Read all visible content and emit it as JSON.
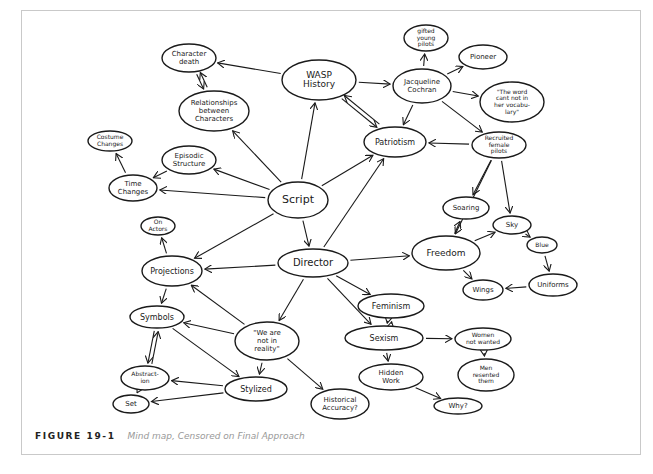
{
  "figure": {
    "caption_label": "FIGURE 19-1",
    "caption_text": "Mind map, Censored on Final Approach"
  },
  "colors": {
    "ink": "#1a1a1a",
    "frame": "#c9c9c9",
    "caption_text": "#999999"
  },
  "nodes": [
    {
      "id": "script",
      "lines": [
        "Script"
      ],
      "cx": 298,
      "cy": 200,
      "rx": 30,
      "ry": 18,
      "fs": 11
    },
    {
      "id": "wasp",
      "lines": [
        "WASP",
        "History"
      ],
      "cx": 319,
      "cy": 80,
      "rx": 37,
      "ry": 20,
      "fs": 9
    },
    {
      "id": "director",
      "lines": [
        "Director"
      ],
      "cx": 313,
      "cy": 263,
      "rx": 35,
      "ry": 14,
      "fs": 10
    },
    {
      "id": "character_death",
      "lines": [
        "Character",
        "death"
      ],
      "cx": 189,
      "cy": 58,
      "rx": 27,
      "ry": 14,
      "fs": 7
    },
    {
      "id": "relationships",
      "lines": [
        "Relationships",
        "between",
        "Characters"
      ],
      "cx": 214,
      "cy": 111,
      "rx": 35,
      "ry": 20,
      "fs": 7
    },
    {
      "id": "costume",
      "lines": [
        "Costume",
        "Changes"
      ],
      "cx": 110,
      "cy": 141,
      "rx": 22,
      "ry": 10,
      "fs": 6
    },
    {
      "id": "episodic",
      "lines": [
        "Episodic",
        "Structure"
      ],
      "cx": 189,
      "cy": 160,
      "rx": 27,
      "ry": 14,
      "fs": 7
    },
    {
      "id": "time",
      "lines": [
        "Time",
        "Changes"
      ],
      "cx": 133,
      "cy": 188,
      "rx": 24,
      "ry": 13,
      "fs": 7
    },
    {
      "id": "on_actors",
      "lines": [
        "On",
        "Actors"
      ],
      "cx": 158,
      "cy": 226,
      "rx": 17,
      "ry": 9,
      "fs": 6
    },
    {
      "id": "projections",
      "lines": [
        "Projections"
      ],
      "cx": 172,
      "cy": 271,
      "rx": 30,
      "ry": 15,
      "fs": 8
    },
    {
      "id": "symbols",
      "lines": [
        "Symbols"
      ],
      "cx": 157,
      "cy": 317,
      "rx": 27,
      "ry": 11,
      "fs": 8
    },
    {
      "id": "not_reality",
      "lines": [
        "\"We are",
        "not in",
        "reality\""
      ],
      "cx": 267,
      "cy": 341,
      "rx": 32,
      "ry": 19,
      "fs": 7
    },
    {
      "id": "abstraction",
      "lines": [
        "Abstract-",
        "ion"
      ],
      "cx": 145,
      "cy": 378,
      "rx": 24,
      "ry": 12,
      "fs": 6
    },
    {
      "id": "stylized",
      "lines": [
        "Stylized"
      ],
      "cx": 256,
      "cy": 389,
      "rx": 31,
      "ry": 12,
      "fs": 8
    },
    {
      "id": "set",
      "lines": [
        "Set"
      ],
      "cx": 131,
      "cy": 404,
      "rx": 18,
      "ry": 9,
      "fs": 7
    },
    {
      "id": "historical",
      "lines": [
        "Historical",
        "Accuracy?"
      ],
      "cx": 340,
      "cy": 404,
      "rx": 29,
      "ry": 15,
      "fs": 7
    },
    {
      "id": "gifted",
      "lines": [
        "gifted",
        "young",
        "pilots"
      ],
      "cx": 426,
      "cy": 38,
      "rx": 22,
      "ry": 13,
      "fs": 6
    },
    {
      "id": "pioneer",
      "lines": [
        "Pioneer"
      ],
      "cx": 483,
      "cy": 57,
      "rx": 24,
      "ry": 12,
      "fs": 7
    },
    {
      "id": "jacqueline",
      "lines": [
        "Jacqueline",
        "Cochran"
      ],
      "cx": 422,
      "cy": 86,
      "rx": 29,
      "ry": 17,
      "fs": 7
    },
    {
      "id": "word_cant",
      "lines": [
        "\"The word",
        "cant not in",
        "her vocabu-",
        "lary\""
      ],
      "cx": 512,
      "cy": 102,
      "rx": 32,
      "ry": 20,
      "fs": 6
    },
    {
      "id": "patriotism",
      "lines": [
        "Patriotism"
      ],
      "cx": 395,
      "cy": 142,
      "rx": 31,
      "ry": 15,
      "fs": 8
    },
    {
      "id": "recruited",
      "lines": [
        "Recruited",
        "female",
        "pilots"
      ],
      "cx": 499,
      "cy": 145,
      "rx": 27,
      "ry": 13,
      "fs": 6
    },
    {
      "id": "soaring",
      "lines": [
        "Soaring"
      ],
      "cx": 466,
      "cy": 208,
      "rx": 23,
      "ry": 11,
      "fs": 7
    },
    {
      "id": "sky",
      "lines": [
        "Sky"
      ],
      "cx": 512,
      "cy": 225,
      "rx": 19,
      "ry": 9,
      "fs": 7
    },
    {
      "id": "freedom",
      "lines": [
        "Freedom"
      ],
      "cx": 446,
      "cy": 253,
      "rx": 34,
      "ry": 17,
      "fs": 9
    },
    {
      "id": "blue",
      "lines": [
        "Blue"
      ],
      "cx": 542,
      "cy": 245,
      "rx": 15,
      "ry": 8,
      "fs": 6
    },
    {
      "id": "wings",
      "lines": [
        "Wings"
      ],
      "cx": 483,
      "cy": 290,
      "rx": 20,
      "ry": 10,
      "fs": 7
    },
    {
      "id": "uniforms",
      "lines": [
        "Uniforms"
      ],
      "cx": 553,
      "cy": 285,
      "rx": 24,
      "ry": 11,
      "fs": 7
    },
    {
      "id": "feminism",
      "lines": [
        "Feminism"
      ],
      "cx": 391,
      "cy": 306,
      "rx": 33,
      "ry": 12,
      "fs": 8
    },
    {
      "id": "sexism",
      "lines": [
        "Sexism"
      ],
      "cx": 384,
      "cy": 338,
      "rx": 39,
      "ry": 12,
      "fs": 8
    },
    {
      "id": "women_not_wanted",
      "lines": [
        "Women",
        "not wanted"
      ],
      "cx": 483,
      "cy": 339,
      "rx": 28,
      "ry": 11,
      "fs": 6
    },
    {
      "id": "men_resented",
      "lines": [
        "Men",
        "resented",
        "them"
      ],
      "cx": 486,
      "cy": 375,
      "rx": 28,
      "ry": 16,
      "fs": 6
    },
    {
      "id": "hidden_work",
      "lines": [
        "Hidden",
        "Work"
      ],
      "cx": 391,
      "cy": 377,
      "rx": 32,
      "ry": 13,
      "fs": 7
    },
    {
      "id": "why",
      "lines": [
        "Why?"
      ],
      "cx": 458,
      "cy": 406,
      "rx": 24,
      "ry": 8,
      "fs": 7
    }
  ],
  "edges": [
    [
      "wasp",
      "character_death"
    ],
    [
      "character_death",
      "relationships"
    ],
    [
      "relationships",
      "character_death"
    ],
    [
      "script",
      "relationships"
    ],
    [
      "script",
      "episodic"
    ],
    [
      "script",
      "time"
    ],
    [
      "episodic",
      "time"
    ],
    [
      "time",
      "costume"
    ],
    [
      "script",
      "wasp"
    ],
    [
      "script",
      "patriotism"
    ],
    [
      "script",
      "director"
    ],
    [
      "script",
      "projections"
    ],
    [
      "wasp",
      "jacqueline"
    ],
    [
      "wasp",
      "patriotism"
    ],
    [
      "patriotism",
      "wasp"
    ],
    [
      "jacqueline",
      "gifted"
    ],
    [
      "jacqueline",
      "pioneer"
    ],
    [
      "jacqueline",
      "word_cant"
    ],
    [
      "jacqueline",
      "patriotism"
    ],
    [
      "jacqueline",
      "recruited"
    ],
    [
      "recruited",
      "patriotism"
    ],
    [
      "recruited",
      "soaring"
    ],
    [
      "recruited",
      "freedom"
    ],
    [
      "recruited",
      "sky"
    ],
    [
      "freedom",
      "soaring"
    ],
    [
      "freedom",
      "sky"
    ],
    [
      "freedom",
      "wings"
    ],
    [
      "sky",
      "blue"
    ],
    [
      "blue",
      "uniforms"
    ],
    [
      "uniforms",
      "wings"
    ],
    [
      "director",
      "patriotism"
    ],
    [
      "director",
      "freedom"
    ],
    [
      "director",
      "projections"
    ],
    [
      "director",
      "not_reality"
    ],
    [
      "director",
      "feminism"
    ],
    [
      "director",
      "sexism"
    ],
    [
      "feminism",
      "sexism"
    ],
    [
      "sexism",
      "feminism"
    ],
    [
      "sexism",
      "women_not_wanted"
    ],
    [
      "women_not_wanted",
      "men_resented"
    ],
    [
      "sexism",
      "hidden_work"
    ],
    [
      "hidden_work",
      "why"
    ],
    [
      "projections",
      "on_actors"
    ],
    [
      "projections",
      "symbols"
    ],
    [
      "not_reality",
      "projections"
    ],
    [
      "not_reality",
      "symbols"
    ],
    [
      "not_reality",
      "stylized"
    ],
    [
      "not_reality",
      "historical"
    ],
    [
      "symbols",
      "abstraction"
    ],
    [
      "abstraction",
      "symbols"
    ],
    [
      "symbols",
      "stylized"
    ],
    [
      "stylized",
      "abstraction"
    ],
    [
      "stylized",
      "set"
    ],
    [
      "abstraction",
      "set"
    ]
  ]
}
